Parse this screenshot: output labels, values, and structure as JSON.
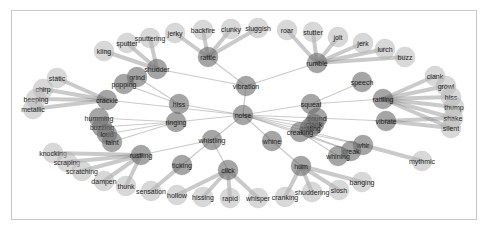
{
  "diagram": {
    "type": "network-graph",
    "root": "noise",
    "colors": {
      "hub": "#6e6e6e",
      "leaf": "#b8b8b8",
      "edge": "#8a8a8a",
      "border": "#c8c8c8",
      "text": "#1e1e1e"
    },
    "nodes": [
      {
        "id": "noise",
        "label": "noise",
        "x": 243,
        "y": 115,
        "hub": true
      },
      {
        "id": "vibration",
        "label": "vibration",
        "x": 246,
        "y": 86,
        "hub": true
      },
      {
        "id": "rattle",
        "label": "rattle",
        "x": 208,
        "y": 57,
        "hub": true
      },
      {
        "id": "rumble",
        "label": "rumble",
        "x": 317,
        "y": 63,
        "hub": true
      },
      {
        "id": "shudder",
        "label": "shudder",
        "x": 157,
        "y": 69,
        "hub": true
      },
      {
        "id": "grind",
        "label": "grind",
        "x": 137,
        "y": 77,
        "hub": true
      },
      {
        "id": "popping",
        "label": "popping",
        "x": 124,
        "y": 84,
        "hub": true
      },
      {
        "id": "crackle",
        "label": "crackle",
        "x": 107,
        "y": 100,
        "hub": true
      },
      {
        "id": "hissle",
        "label": "hiss",
        "x": 179,
        "y": 104,
        "hub": true
      },
      {
        "id": "ringing",
        "label": "ringing",
        "x": 176,
        "y": 122,
        "hub": true
      },
      {
        "id": "humming",
        "label": "humming",
        "x": 99,
        "y": 118,
        "hub": true
      },
      {
        "id": "buzzing",
        "label": "buzzing",
        "x": 102,
        "y": 127,
        "hub": true
      },
      {
        "id": "loud",
        "label": "loud",
        "x": 107,
        "y": 134,
        "hub": true
      },
      {
        "id": "faint",
        "label": "faint",
        "x": 112,
        "y": 142,
        "hub": true
      },
      {
        "id": "rustling",
        "label": "rustling",
        "x": 141,
        "y": 155,
        "hub": true
      },
      {
        "id": "whistling",
        "label": "whistling",
        "x": 212,
        "y": 140,
        "hub": true
      },
      {
        "id": "ticking",
        "label": "ticking",
        "x": 182,
        "y": 165,
        "hub": true
      },
      {
        "id": "click",
        "label": "click",
        "x": 228,
        "y": 170,
        "hub": true
      },
      {
        "id": "squeal",
        "label": "squeal",
        "x": 311,
        "y": 104,
        "hub": true
      },
      {
        "id": "sound",
        "label": "sound",
        "x": 317,
        "y": 118,
        "hub": true
      },
      {
        "id": "clank2",
        "label": "clank",
        "x": 314,
        "y": 124,
        "hub": true
      },
      {
        "id": "grating",
        "label": "grating",
        "x": 310,
        "y": 128,
        "hub": true
      },
      {
        "id": "creaking",
        "label": "creaking",
        "x": 300,
        "y": 132,
        "hub": true
      },
      {
        "id": "speech",
        "label": "speech",
        "x": 362,
        "y": 82,
        "hub": true
      },
      {
        "id": "rattling",
        "label": "rattling",
        "x": 383,
        "y": 99,
        "hub": true
      },
      {
        "id": "vibrate",
        "label": "vibrate",
        "x": 386,
        "y": 121,
        "hub": true
      },
      {
        "id": "whine",
        "label": "whine",
        "x": 272,
        "y": 141,
        "hub": true
      },
      {
        "id": "hum",
        "label": "hum",
        "x": 301,
        "y": 166,
        "hub": true
      },
      {
        "id": "whir",
        "label": "whir",
        "x": 363,
        "y": 145,
        "hub": true
      },
      {
        "id": "creak",
        "label": "creak",
        "x": 351,
        "y": 151,
        "hub": true
      },
      {
        "id": "whining",
        "label": "whining",
        "x": 338,
        "y": 156,
        "hub": true
      },
      {
        "id": "kling",
        "label": "kling",
        "x": 104,
        "y": 51
      },
      {
        "id": "sputter",
        "label": "sputter",
        "x": 127,
        "y": 43
      },
      {
        "id": "sputtering",
        "label": "sputtering",
        "x": 150,
        "y": 38
      },
      {
        "id": "jerky",
        "label": "jerky",
        "x": 175,
        "y": 33
      },
      {
        "id": "backfire",
        "label": "backfire",
        "x": 203,
        "y": 30
      },
      {
        "id": "clunky",
        "label": "clunky",
        "x": 231,
        "y": 29
      },
      {
        "id": "sluggish",
        "label": "sluggish",
        "x": 258,
        "y": 28
      },
      {
        "id": "roar",
        "label": "roar",
        "x": 287,
        "y": 30
      },
      {
        "id": "stutter",
        "label": "stutter",
        "x": 313,
        "y": 32
      },
      {
        "id": "jolt",
        "label": "jolt",
        "x": 338,
        "y": 37
      },
      {
        "id": "jerk",
        "label": "jerk",
        "x": 363,
        "y": 43
      },
      {
        "id": "lurch",
        "label": "lurch",
        "x": 385,
        "y": 49
      },
      {
        "id": "buzz",
        "label": "buzz",
        "x": 405,
        "y": 57
      },
      {
        "id": "static",
        "label": "static",
        "x": 57,
        "y": 78
      },
      {
        "id": "chirp",
        "label": "chirp",
        "x": 43,
        "y": 89
      },
      {
        "id": "beeping",
        "label": "beeping",
        "x": 36,
        "y": 99
      },
      {
        "id": "metallic",
        "label": "metallic",
        "x": 33,
        "y": 109
      },
      {
        "id": "clank",
        "label": "clank",
        "x": 435,
        "y": 76
      },
      {
        "id": "growl",
        "label": "growl",
        "x": 446,
        "y": 86
      },
      {
        "id": "hiss",
        "label": "hiss",
        "x": 451,
        "y": 97
      },
      {
        "id": "thump",
        "label": "thump",
        "x": 454,
        "y": 107
      },
      {
        "id": "shake",
        "label": "shake",
        "x": 453,
        "y": 118
      },
      {
        "id": "silent",
        "label": "silent",
        "x": 451,
        "y": 128
      },
      {
        "id": "mythmic",
        "label": "mythmic",
        "x": 422,
        "y": 161
      },
      {
        "id": "knocking",
        "label": "knocking",
        "x": 53,
        "y": 153
      },
      {
        "id": "scraping",
        "label": "scraping",
        "x": 67,
        "y": 162
      },
      {
        "id": "scratching",
        "label": "scratching",
        "x": 82,
        "y": 171
      },
      {
        "id": "dampen",
        "label": "dampen",
        "x": 104,
        "y": 181
      },
      {
        "id": "thunk",
        "label": "thunk",
        "x": 126,
        "y": 186
      },
      {
        "id": "sensation",
        "label": "sensation",
        "x": 151,
        "y": 191
      },
      {
        "id": "hollow",
        "label": "hollow",
        "x": 177,
        "y": 195
      },
      {
        "id": "hissing",
        "label": "hissing",
        "x": 203,
        "y": 197
      },
      {
        "id": "rapid",
        "label": "rapid",
        "x": 230,
        "y": 198
      },
      {
        "id": "whisper",
        "label": "whisper",
        "x": 258,
        "y": 198
      },
      {
        "id": "cranking",
        "label": "cranking",
        "x": 285,
        "y": 197
      },
      {
        "id": "shuddering",
        "label": "shuddering",
        "x": 312,
        "y": 192
      },
      {
        "id": "slosh",
        "label": "slosh",
        "x": 339,
        "y": 190
      },
      {
        "id": "banging",
        "label": "banging",
        "x": 362,
        "y": 182
      }
    ],
    "edges": [
      [
        "noise",
        "vibration"
      ],
      [
        "noise",
        "hissle"
      ],
      [
        "noise",
        "ringing"
      ],
      [
        "noise",
        "crackle"
      ],
      [
        "noise",
        "whistling"
      ],
      [
        "noise",
        "whine"
      ],
      [
        "noise",
        "squeal"
      ],
      [
        "noise",
        "sound"
      ],
      [
        "noise",
        "clank2"
      ],
      [
        "noise",
        "grating"
      ],
      [
        "noise",
        "creaking"
      ],
      [
        "noise",
        "whir"
      ],
      [
        "noise",
        "creak"
      ],
      [
        "vibration",
        "rattle"
      ],
      [
        "vibration",
        "rumble"
      ],
      [
        "vibration",
        "shudder"
      ],
      [
        "rattle",
        "jerky"
      ],
      [
        "rattle",
        "backfire"
      ],
      [
        "rattle",
        "clunky"
      ],
      [
        "rattle",
        "sluggish"
      ],
      [
        "rumble",
        "roar"
      ],
      [
        "rumble",
        "stutter"
      ],
      [
        "rumble",
        "jolt"
      ],
      [
        "rumble",
        "jerk"
      ],
      [
        "rumble",
        "lurch"
      ],
      [
        "rumble",
        "buzz"
      ],
      [
        "shudder",
        "kling"
      ],
      [
        "shudder",
        "sputter"
      ],
      [
        "shudder",
        "sputtering"
      ],
      [
        "hissle",
        "grind"
      ],
      [
        "hissle",
        "popping"
      ],
      [
        "crackle",
        "static"
      ],
      [
        "crackle",
        "chirp"
      ],
      [
        "crackle",
        "beeping"
      ],
      [
        "crackle",
        "metallic"
      ],
      [
        "ringing",
        "humming"
      ],
      [
        "ringing",
        "buzzing"
      ],
      [
        "ringing",
        "loud"
      ],
      [
        "ringing",
        "faint"
      ],
      [
        "whistling",
        "rustling"
      ],
      [
        "whistling",
        "ticking"
      ],
      [
        "whistling",
        "click"
      ],
      [
        "rustling",
        "knocking"
      ],
      [
        "rustling",
        "scraping"
      ],
      [
        "rustling",
        "scratching"
      ],
      [
        "rustling",
        "dampen"
      ],
      [
        "rustling",
        "thunk"
      ],
      [
        "ticking",
        "sensation"
      ],
      [
        "click",
        "hollow"
      ],
      [
        "click",
        "hissing"
      ],
      [
        "click",
        "rapid"
      ],
      [
        "click",
        "whisper"
      ],
      [
        "squeal",
        "speech"
      ],
      [
        "squeal",
        "rattling"
      ],
      [
        "rattling",
        "clank"
      ],
      [
        "rattling",
        "growl"
      ],
      [
        "rattling",
        "hiss"
      ],
      [
        "rattling",
        "thump"
      ],
      [
        "rattling",
        "shake"
      ],
      [
        "rattling",
        "silent"
      ],
      [
        "sound",
        "vibrate"
      ],
      [
        "vibrate",
        "shake"
      ],
      [
        "vibrate",
        "silent"
      ],
      [
        "creaking",
        "whining"
      ],
      [
        "creaking",
        "creak"
      ],
      [
        "creaking",
        "whir"
      ],
      [
        "whir",
        "mythmic"
      ],
      [
        "whine",
        "hum"
      ],
      [
        "hum",
        "cranking"
      ],
      [
        "hum",
        "shuddering"
      ],
      [
        "hum",
        "slosh"
      ],
      [
        "hum",
        "banging"
      ]
    ]
  }
}
